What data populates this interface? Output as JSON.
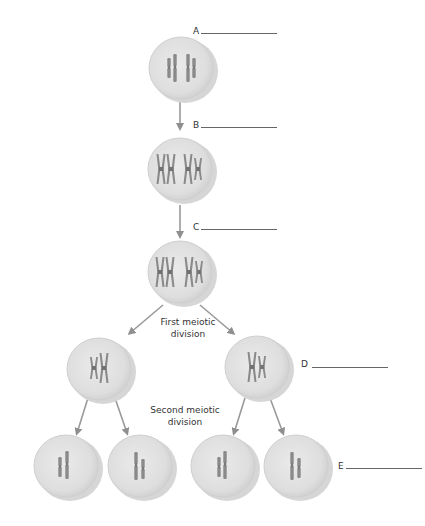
{
  "colors": {
    "cell_fill": "#e2e2e2",
    "cell_edge": "#cfcfcf",
    "cell_shadow": "#d9d9d9",
    "chromosome": "#8a8a8a",
    "chromosome_dark": "#6f6f6f",
    "arrow": "#9a9a9a",
    "line": "#666666",
    "text": "#333333"
  },
  "labels": {
    "a": {
      "letter": "A"
    },
    "b": {
      "letter": "B"
    },
    "c": {
      "letter": "C"
    },
    "d": {
      "letter": "D"
    },
    "e": {
      "letter": "E"
    }
  },
  "captions": {
    "first_division_line1": "First meiotic",
    "first_division_line2": "division",
    "second_division_line1": "Second meiotic",
    "second_division_line2": "division"
  },
  "cells": [
    {
      "id": "cell-1",
      "stage": "unreplicated",
      "chromosomes": 4
    },
    {
      "id": "cell-2",
      "stage": "replicated",
      "chromosomes": 4
    },
    {
      "id": "cell-3",
      "stage": "replicated-aligned",
      "chromosomes": 4
    },
    {
      "id": "cell-4",
      "stage": "after-meiosis-I-left",
      "chromosomes": 2
    },
    {
      "id": "cell-5",
      "stage": "after-meiosis-I-right",
      "chromosomes": 2
    },
    {
      "id": "cell-6",
      "stage": "gamete",
      "chromosomes": 2
    },
    {
      "id": "cell-7",
      "stage": "gamete",
      "chromosomes": 2
    },
    {
      "id": "cell-8",
      "stage": "gamete",
      "chromosomes": 2
    },
    {
      "id": "cell-9",
      "stage": "gamete",
      "chromosomes": 2
    }
  ]
}
